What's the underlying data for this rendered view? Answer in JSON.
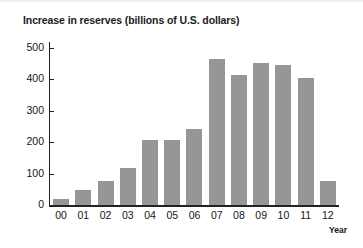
{
  "chart_data": {
    "type": "bar",
    "title": "Increase in reserves (billions of U.S. dollars)",
    "xlabel": "Year",
    "ylabel": "",
    "categories": [
      "00",
      "01",
      "02",
      "03",
      "04",
      "05",
      "06",
      "07",
      "08",
      "09",
      "10",
      "11",
      "12"
    ],
    "values": [
      18,
      48,
      75,
      117,
      207,
      207,
      243,
      465,
      415,
      452,
      447,
      405,
      75
    ],
    "ylim": [
      0,
      500
    ],
    "yticks": [
      0,
      100,
      200,
      300,
      400,
      500
    ],
    "ytick_labels": [
      "0",
      "100",
      "200",
      "300",
      "400",
      "500"
    ],
    "grid": false,
    "legend": null,
    "bar_color": "#969696",
    "axis_color": "#222222",
    "background": "#ffffff"
  }
}
